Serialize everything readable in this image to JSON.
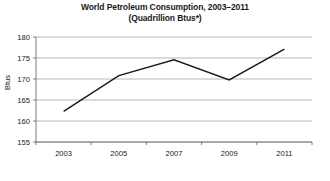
{
  "chart_data": {
    "type": "line",
    "title": "World Petroleum Consumption, 2003–2011",
    "subtitle": "(Quadrillion Btus*)",
    "xlabel": "",
    "ylabel": "Btus",
    "x": [
      2003,
      2005,
      2007,
      2009,
      2011
    ],
    "categories": [
      "2003",
      "2005",
      "2007",
      "2009",
      "2011"
    ],
    "values": [
      162.3,
      170.8,
      174.6,
      169.8,
      177.1
    ],
    "series": [
      {
        "name": "World Petroleum Consumption",
        "values": [
          162.3,
          170.8,
          174.6,
          169.8,
          177.1
        ]
      }
    ],
    "ylim": [
      155,
      180
    ],
    "xlim": [
      2002,
      2012
    ],
    "ytick_labels": [
      "180",
      "175",
      "170",
      "165",
      "160",
      "155"
    ],
    "ytick_values": [
      180,
      175,
      170,
      165,
      160,
      155
    ],
    "xtick_labels": [
      "2003",
      "2005",
      "2007",
      "2009",
      "2011"
    ],
    "xtick_values": [
      2003,
      2005,
      2007,
      2009,
      2011
    ],
    "x_minor_ticks": [
      2002,
      2004,
      2006,
      2008,
      2010,
      2012
    ],
    "grid": true,
    "grid_axis": "y",
    "legend": false,
    "legend_position": "none",
    "line_color": "#1a1a1a",
    "grid_color": "#9a9a9a",
    "axis_color": "#6e6e6e",
    "background_color": "#ffffff"
  }
}
